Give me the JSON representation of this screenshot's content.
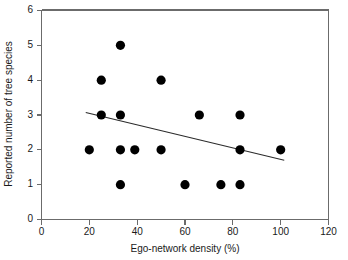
{
  "chart_data": {
    "type": "scatter",
    "title": "",
    "subtitle": "",
    "xlabel": "Ego-network density (%)",
    "ylabel": "Reported number of tree species",
    "xlim": [
      0,
      120
    ],
    "ylim": [
      0,
      6
    ],
    "xticks": [
      0,
      20,
      40,
      60,
      80,
      100,
      120
    ],
    "yticks": [
      0,
      1,
      2,
      3,
      4,
      5,
      6
    ],
    "xticklabels": [
      "0",
      "20",
      "40",
      "60",
      "80",
      "100",
      "120"
    ],
    "yticklabels": [
      "0",
      "1",
      "2",
      "3",
      "4",
      "5",
      "6"
    ],
    "grid": false,
    "legend": null,
    "legend_position": "none",
    "marker": {
      "shape": "circle",
      "color": "#000000",
      "size": 5
    },
    "series": [
      {
        "name": "Observations",
        "x": [
          33,
          25,
          50,
          25,
          33,
          66,
          83,
          20,
          33,
          39,
          50,
          83,
          100,
          33,
          60,
          75,
          83
        ],
        "y": [
          5,
          4,
          4,
          3,
          3,
          3,
          3,
          2,
          2,
          2,
          2,
          2,
          2,
          1,
          1,
          1,
          1
        ],
        "points": [
          {
            "density": 33,
            "species": 5
          },
          {
            "density": 25,
            "species": 4
          },
          {
            "density": 50,
            "species": 4
          },
          {
            "density": 25,
            "species": 3
          },
          {
            "density": 33,
            "species": 3
          },
          {
            "density": 66,
            "species": 3
          },
          {
            "density": 83,
            "species": 3
          },
          {
            "density": 20,
            "species": 2
          },
          {
            "density": 33,
            "species": 2
          },
          {
            "density": 39,
            "species": 2
          },
          {
            "density": 50,
            "species": 2
          },
          {
            "density": 83,
            "species": 2
          },
          {
            "density": 100,
            "species": 2
          },
          {
            "density": 33,
            "species": 1
          },
          {
            "density": 60,
            "species": 1
          },
          {
            "density": 75,
            "species": 1
          },
          {
            "density": 83,
            "species": 1
          }
        ]
      }
    ],
    "trendline": {
      "name": "Linear fit",
      "x_start": 18.5,
      "y_start": 3.07,
      "x_end": 101.5,
      "y_end": 1.7,
      "color": "#2b2b2b"
    },
    "axis_color": "#6b6b6b",
    "background": "#ffffff"
  }
}
